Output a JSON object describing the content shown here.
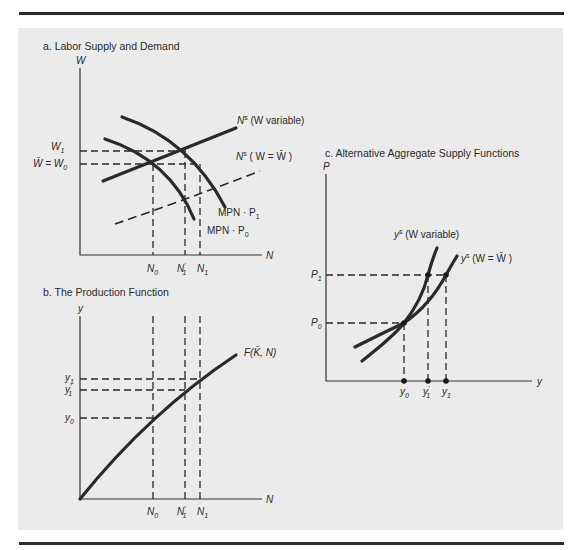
{
  "figure": {
    "panels": [
      {
        "id": "a",
        "title": "a.  Labor Supply and Demand",
        "y_axis_label": "W",
        "x_axis_label": "N",
        "y_ticks": [
          {
            "label": "W",
            "sub": "1"
          },
          {
            "label": "W̄ = W",
            "sub": "0"
          }
        ],
        "x_ticks": [
          {
            "label": "N",
            "sub": "0"
          },
          {
            "label": "N",
            "sub": "1",
            "prime": "'"
          },
          {
            "label": "N",
            "sub": "1"
          }
        ],
        "curves": [
          {
            "name": "labor-supply-variable",
            "label": "N",
            "sup": "s",
            "suffix": " (W variable)"
          },
          {
            "name": "labor-supply-fixed-wage",
            "label": "N",
            "sup": "s",
            "suffix": " ( W = W̄ )"
          },
          {
            "name": "labor-demand-p1",
            "label": "MPN · P",
            "sub": "1"
          },
          {
            "name": "labor-demand-p0",
            "label": "MPN · P",
            "sub": "0"
          }
        ]
      },
      {
        "id": "b",
        "title": "b.  The Production Function",
        "y_axis_label": "y",
        "x_axis_label": "N",
        "y_ticks": [
          {
            "label": "y",
            "sub": "1"
          },
          {
            "label": "y",
            "sub": "1",
            "prime": "'"
          },
          {
            "label": "y",
            "sub": "0"
          }
        ],
        "x_ticks": [
          {
            "label": "N",
            "sub": "0"
          },
          {
            "label": "N",
            "sub": "1",
            "prime": "'"
          },
          {
            "label": "N",
            "sub": "1"
          }
        ],
        "curves": [
          {
            "name": "production-function",
            "label": "F(K̄, N)"
          }
        ]
      },
      {
        "id": "c",
        "title": "c.  Alternative Aggregate Supply Functions",
        "y_axis_label": "P",
        "x_axis_label": "y",
        "y_ticks": [
          {
            "label": "P",
            "sub": "1"
          },
          {
            "label": "P",
            "sub": "0"
          }
        ],
        "x_ticks": [
          {
            "label": "y",
            "sub": "0"
          },
          {
            "label": "y",
            "sub": "1",
            "prime": "'"
          },
          {
            "label": "y",
            "sub": "1"
          }
        ],
        "curves": [
          {
            "name": "aggregate-supply-variable-wage",
            "label": "y",
            "sup": "s",
            "suffix": " (W variable)"
          },
          {
            "name": "aggregate-supply-fixed-wage",
            "label": "y",
            "sup": "s",
            "suffix": " (W = W̄ )"
          }
        ]
      }
    ]
  }
}
